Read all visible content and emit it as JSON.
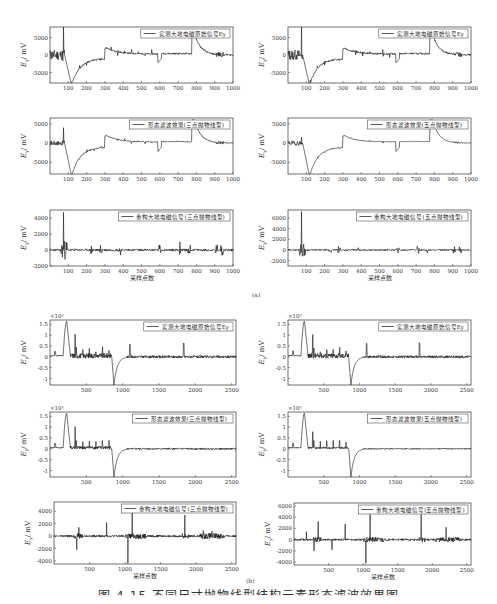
{
  "figure": {
    "caption": "图 4-15 不同尺寸抛物线型结构元素形态滤波效果图",
    "subfig_a_label": "(a)",
    "subfig_b_label": "(b)"
  },
  "chart_data": [
    {
      "id": "a1",
      "type": "line",
      "title": "",
      "legend": "实测大地电磁原始信号Ey",
      "xlabel": "",
      "ylabel": "Ey/mV",
      "xlim": [
        0,
        1000
      ],
      "ylim": [
        -8000,
        8000
      ],
      "xticks": [
        100,
        200,
        300,
        400,
        500,
        600,
        700,
        800,
        900,
        1000
      ],
      "yticks": [
        -5000,
        0,
        5000
      ],
      "multiplier": "",
      "series_hint": "raw MT signal with spike at ~75 (~8000), dip to ~-8000 at ~110, recovery to 0 by ~300, step up ~2000 at 300, dip -2500 at 600, jump to ~6000 at 780 decaying to 0 by ~900"
    },
    {
      "id": "a2",
      "type": "line",
      "legend": "实测大地电磁原始信号Ey",
      "xlabel": "",
      "ylabel": "Ey/mV",
      "xlim": [
        0,
        1000
      ],
      "ylim": [
        -8000,
        8000
      ],
      "xticks": [
        100,
        200,
        300,
        400,
        500,
        600,
        700,
        800,
        900,
        1000
      ],
      "yticks": [
        -5000,
        0,
        5000
      ],
      "multiplier": ""
    },
    {
      "id": "a3",
      "type": "line",
      "legend": "形态滤波效果(三点抛物线型)",
      "xlabel": "",
      "ylabel": "Ey/mV",
      "xlim": [
        0,
        1000
      ],
      "ylim": [
        -8000,
        6500
      ],
      "xticks": [
        100,
        200,
        300,
        400,
        500,
        600,
        700,
        800,
        900,
        1000
      ],
      "yticks": [
        -5000,
        0,
        5000
      ],
      "multiplier": ""
    },
    {
      "id": "a4",
      "type": "line",
      "legend": "形态滤波效果(五点抛物线型)",
      "xlabel": "",
      "ylabel": "Ey/mV",
      "xlim": [
        0,
        1000
      ],
      "ylim": [
        -8000,
        6500
      ],
      "xticks": [
        100,
        200,
        300,
        400,
        500,
        600,
        700,
        800,
        900,
        1000
      ],
      "yticks": [
        -5000,
        0,
        5000
      ],
      "multiplier": ""
    },
    {
      "id": "a5",
      "type": "line",
      "legend": "重构大地电磁信号(三点抛物线型)",
      "xlabel": "采样点数",
      "ylabel": "Ey/mV",
      "xlim": [
        0,
        1000
      ],
      "ylim": [
        -2000,
        5000
      ],
      "xticks": [
        100,
        200,
        300,
        400,
        500,
        600,
        700,
        800,
        900,
        1000
      ],
      "yticks": [
        -2000,
        0,
        2000,
        4000
      ],
      "multiplier": ""
    },
    {
      "id": "a6",
      "type": "line",
      "legend": "重构大地电磁信号(五点抛物线型)",
      "xlabel": "采样点数",
      "ylabel": "Ey/mV",
      "xlim": [
        0,
        1000
      ],
      "ylim": [
        -3000,
        7500
      ],
      "xticks": [
        100,
        200,
        300,
        400,
        500,
        600,
        700,
        800,
        900,
        1000
      ],
      "yticks": [
        -2000,
        0,
        2000,
        4000,
        6000
      ],
      "multiplier": ""
    },
    {
      "id": "b1",
      "type": "line",
      "legend": "实测大地电磁原始信号Ey",
      "xlabel": "",
      "ylabel": "Ey/mV",
      "xlim": [
        0,
        2560
      ],
      "ylim": [
        -1.3,
        1.7
      ],
      "xticks": [
        500,
        1000,
        1500,
        2000,
        2500
      ],
      "yticks": [
        -1,
        -0.5,
        0,
        0.5,
        1,
        1.5
      ],
      "multiplier": "×10⁴"
    },
    {
      "id": "b2",
      "type": "line",
      "legend": "实测大地电磁原始信号Ey",
      "xlabel": "",
      "ylabel": "Ey/mV",
      "xlim": [
        0,
        2560
      ],
      "ylim": [
        -1.3,
        1.7
      ],
      "xticks": [
        500,
        1000,
        1500,
        2000,
        2500
      ],
      "yticks": [
        -1,
        -0.5,
        0,
        0.5,
        1,
        1.5
      ],
      "multiplier": "×10⁴"
    },
    {
      "id": "b3",
      "type": "line",
      "legend": "形态滤波效果(三点抛物线型)",
      "xlabel": "",
      "ylabel": "Ey/mV",
      "xlim": [
        0,
        2560
      ],
      "ylim": [
        -1.3,
        1.7
      ],
      "xticks": [
        500,
        1000,
        1500,
        2000,
        2500
      ],
      "yticks": [
        -1,
        -0.5,
        0,
        0.5,
        1,
        1.5
      ],
      "multiplier": "×10⁴"
    },
    {
      "id": "b4",
      "type": "line",
      "legend": "形态滤波效果(五点抛物线型)",
      "xlabel": "",
      "ylabel": "Ey/mV",
      "xlim": [
        0,
        2560
      ],
      "ylim": [
        -1.3,
        1.7
      ],
      "xticks": [
        500,
        1000,
        1500,
        2000,
        2500
      ],
      "yticks": [
        -1,
        -0.5,
        0,
        0.5,
        1,
        1.5
      ],
      "multiplier": "×10⁴"
    },
    {
      "id": "b5",
      "type": "line",
      "legend": "重构大地电磁信号(三点抛物线型)",
      "xlabel": "采样点数",
      "ylabel": "Ey/mV",
      "xlim": [
        0,
        2560
      ],
      "ylim": [
        -4500,
        5500
      ],
      "xticks": [
        500,
        1000,
        1500,
        2000,
        2500
      ],
      "yticks": [
        -4000,
        -2000,
        0,
        2000,
        4000
      ],
      "multiplier": ""
    },
    {
      "id": "b6",
      "type": "line",
      "legend": "重构大地电磁信号(五点抛物线型)",
      "xlabel": "采样点数",
      "ylabel": "Ey/mV",
      "xlim": [
        0,
        2560
      ],
      "ylim": [
        -4500,
        6500
      ],
      "xticks": [
        500,
        1000,
        1500,
        2000,
        2500
      ],
      "yticks": [
        -4000,
        -2000,
        0,
        2000,
        4000,
        6000
      ],
      "multiplier": ""
    }
  ]
}
